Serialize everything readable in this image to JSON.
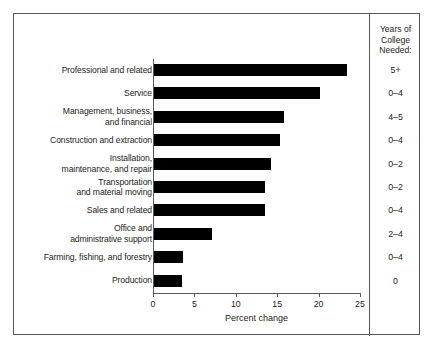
{
  "chart_data": {
    "type": "bar",
    "orientation": "horizontal",
    "title": "",
    "xlabel": "Percent change",
    "ylabel": "",
    "xlim": [
      0,
      25
    ],
    "xticks": [
      0,
      5,
      10,
      15,
      20,
      25
    ],
    "xtick_labels": [
      "0",
      "5",
      "10",
      "15",
      "20",
      "25"
    ],
    "grid": false,
    "legend": null,
    "bar_color": "#000000",
    "categories": [
      "Professional and related",
      "Service",
      "Management, business,\nand financial",
      "Construction and extraction",
      "Installation,\nmaintenance, and repair",
      "Transportation\nand material moving",
      "Sales and related",
      "Office and\nadministrative support",
      "Farming, fishing, and forestry",
      "Production"
    ],
    "values": [
      23.3,
      20.1,
      15.7,
      15.2,
      14.1,
      13.4,
      13.4,
      7.0,
      3.5,
      3.4
    ],
    "annotations": {
      "right_column_header": "Years of College Needed:",
      "right_column_values": [
        "5+",
        "0–4",
        "4–5",
        "0–4",
        "0–2",
        "0–2",
        "0–4",
        "2–4",
        "0–4",
        "0"
      ]
    }
  },
  "categories": [
    {
      "label_line1": "Professional and related",
      "label_line2": "",
      "value": 23.3,
      "years_college": "5+"
    },
    {
      "label_line1": "Service",
      "label_line2": "",
      "value": 20.1,
      "years_college": "0–4"
    },
    {
      "label_line1": "Management, business,",
      "label_line2": "and financial",
      "value": 15.7,
      "years_college": "4–5"
    },
    {
      "label_line1": "Construction and extraction",
      "label_line2": "",
      "value": 15.2,
      "years_college": "0–4"
    },
    {
      "label_line1": "Installation,",
      "label_line2": "maintenance, and repair",
      "value": 14.1,
      "years_college": "0–2"
    },
    {
      "label_line1": "Transportation",
      "label_line2": "and material moving",
      "value": 13.4,
      "years_college": "0–2"
    },
    {
      "label_line1": "Sales and related",
      "label_line2": "",
      "value": 13.4,
      "years_college": "0–4"
    },
    {
      "label_line1": "Office and",
      "label_line2": "administrative support",
      "value": 7.0,
      "years_college": "2–4"
    },
    {
      "label_line1": "Farming, fishing, and forestry",
      "label_line2": "",
      "value": 3.5,
      "years_college": "0–4"
    },
    {
      "label_line1": "Production",
      "label_line2": "",
      "value": 3.4,
      "years_college": "0"
    }
  ],
  "axis": {
    "title": "Percent change",
    "tick_labels": [
      "0",
      "5",
      "10",
      "15",
      "20",
      "25"
    ]
  },
  "right_column": {
    "header_line1": "Years of",
    "header_line2": "College",
    "header_line3": "Needed:"
  }
}
